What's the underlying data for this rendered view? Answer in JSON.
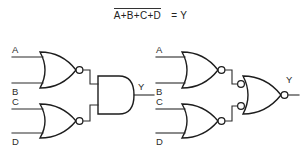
{
  "equation": {
    "expression": "A+B+C+D",
    "overbar": true,
    "equals": "=",
    "output": "Y"
  },
  "colors": {
    "background": "#ffffff",
    "wire": "#2b2b2b",
    "gate_outline": "#1d1d1d",
    "text": "#2b2b2b"
  },
  "circuits": [
    {
      "id": "left-circuit",
      "name": "nor-nor-into-and",
      "gates": [
        {
          "id": "g1",
          "type": "NOR",
          "inputs": [
            "A",
            "B"
          ],
          "output_bubble": true,
          "input_bubbles": false
        },
        {
          "id": "g2",
          "type": "NOR",
          "inputs": [
            "C",
            "D"
          ],
          "output_bubble": true,
          "input_bubbles": false
        },
        {
          "id": "g3",
          "type": "AND",
          "inputs": [
            "g1",
            "g2"
          ],
          "output_bubble": false,
          "input_bubbles": false
        }
      ],
      "input_labels": [
        "A",
        "B",
        "C",
        "D"
      ],
      "output_label": "Y"
    },
    {
      "id": "right-circuit",
      "name": "nor-nor-into-bubbled-input-nor",
      "gates": [
        {
          "id": "g4",
          "type": "NOR",
          "inputs": [
            "A",
            "B"
          ],
          "output_bubble": true,
          "input_bubbles": false
        },
        {
          "id": "g5",
          "type": "NOR",
          "inputs": [
            "C",
            "D"
          ],
          "output_bubble": true,
          "input_bubbles": false
        },
        {
          "id": "g6",
          "type": "NOR",
          "inputs": [
            "g4",
            "g5"
          ],
          "output_bubble": true,
          "input_bubbles": true
        }
      ],
      "input_labels": [
        "A",
        "B",
        "C",
        "D"
      ],
      "output_label": "Y"
    }
  ],
  "labels": {
    "a": "A",
    "b": "B",
    "c": "C",
    "d": "D",
    "y": "Y"
  }
}
